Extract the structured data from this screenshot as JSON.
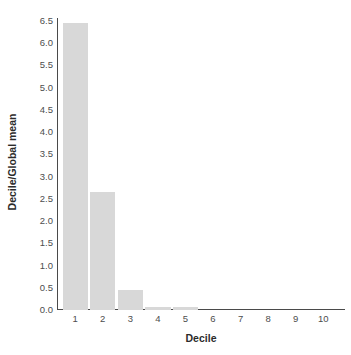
{
  "chart_data": {
    "type": "bar",
    "title": "",
    "xlabel": "Decile",
    "ylabel": "Decile/Global mean",
    "categories": [
      "1",
      "2",
      "3",
      "4",
      "5",
      "6",
      "7",
      "8",
      "9",
      "10"
    ],
    "values": [
      6.45,
      2.65,
      0.45,
      0.07,
      0.06,
      0.0,
      0.0,
      0.0,
      0.0,
      0.0
    ],
    "ylim": [
      0,
      6.5
    ],
    "xlim_categories": 10,
    "ytick_labels": [
      "0.0",
      "0.5",
      "1.0",
      "1.5",
      "2.0",
      "2.5",
      "3.0",
      "3.5",
      "4.0",
      "4.5",
      "5.0",
      "5.5",
      "6.0",
      "6.5"
    ],
    "ytick_values": [
      0.0,
      0.5,
      1.0,
      1.5,
      2.0,
      2.5,
      3.0,
      3.5,
      4.0,
      4.5,
      5.0,
      5.5,
      6.0,
      6.5
    ],
    "grid": false,
    "legend": false,
    "legend_position": "none",
    "bar_color": "#d8d8d8",
    "axis_color": "#4a4a4a",
    "text_color": "#4d4d4d",
    "title_color": "#2b2b2b",
    "background": "#ffffff"
  }
}
